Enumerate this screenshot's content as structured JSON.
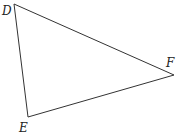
{
  "diagram": {
    "type": "triangle",
    "stroke_color": "#333333",
    "vertices": [
      {
        "name": "D",
        "x": 14,
        "y": 4,
        "label_x": 2,
        "label_y": 15
      },
      {
        "name": "F",
        "x": 174,
        "y": 75,
        "label_x": 166,
        "label_y": 67
      },
      {
        "name": "E",
        "x": 28,
        "y": 117,
        "label_x": 19,
        "label_y": 132
      }
    ],
    "labels": {
      "d": "D",
      "e": "E",
      "f": "F"
    }
  }
}
